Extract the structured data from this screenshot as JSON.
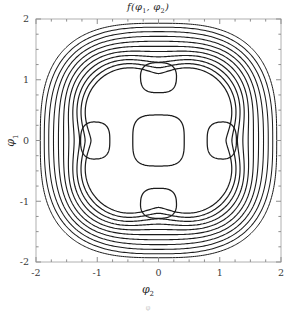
{
  "figure": {
    "title": "f(φ",
    "title_full": "f(φ1, φ2)",
    "title_parts": {
      "fn": "f(φ",
      "sub1": "1",
      "mid": ", φ",
      "sub2": "2",
      "close": ")"
    },
    "background_color": "#ffffff",
    "frame_color": "#b8b8b8",
    "contour_color": "#1c1c1c"
  },
  "axes": {
    "x_label_parts": {
      "sym": "φ",
      "sub": "2"
    },
    "y_label_parts": {
      "sym": "φ",
      "sub": "1"
    },
    "x_ticks": [
      "-2",
      "-1",
      "0",
      "1",
      "2"
    ],
    "y_ticks": [
      "2",
      "1",
      "0",
      "-1",
      "-2"
    ],
    "x_tick_values": [
      -2,
      -1,
      0,
      1,
      2
    ],
    "y_tick_values": [
      2,
      1,
      0,
      -1,
      -2
    ],
    "xlim": [
      -2,
      2
    ],
    "ylim": [
      -2,
      2
    ],
    "minor_ticks_per_interval": 4
  },
  "caption": {
    "text": "φ"
  },
  "chart_data": {
    "type": "contour",
    "title": "f(φ1, φ2)",
    "xlabel": "φ2",
    "ylabel": "φ1",
    "xlim": [
      -2,
      2
    ],
    "ylim": [
      -2,
      2
    ],
    "grid": false,
    "legend": "none",
    "features": {
      "central_basin": {
        "center": [
          0,
          0
        ],
        "half_width": 0.42,
        "shape": "rounded-square"
      },
      "satellites": [
        {
          "center": [
            0,
            1
          ],
          "radius": 0.25
        },
        {
          "center": [
            0,
            -1
          ],
          "radius": 0.25
        },
        {
          "center": [
            -1,
            0
          ],
          "radius": 0.25
        },
        {
          "center": [
            1,
            0
          ],
          "radius": 0.25
        }
      ],
      "outer_contour_count": 11,
      "outer_shape": "rounded-diamond",
      "outer_extent_min": 1.32,
      "outer_extent_max": 1.93
    },
    "levels": [
      0.1,
      0.2,
      0.3,
      0.4,
      0.5,
      0.6,
      0.7,
      0.8,
      0.9,
      1.0,
      1.1,
      1.2,
      1.3,
      1.4,
      1.5
    ]
  }
}
